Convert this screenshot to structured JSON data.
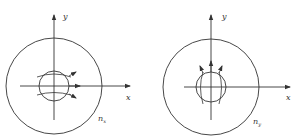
{
  "figure": {
    "panels": [
      {
        "id": "left",
        "axis_labels": {
          "x": "x",
          "y": "y"
        },
        "region_label": "n",
        "region_subscript": "x",
        "description": "Outer circle with small inner circle at origin; curved lines inside inner circle with arrows pointing along +x direction"
      },
      {
        "id": "right",
        "axis_labels": {
          "x": "x",
          "y": "y"
        },
        "region_label": "n",
        "region_subscript": "y",
        "description": "Outer circle with small inner circle at origin; curved lines inside inner circle with arrows pointing along +y direction"
      }
    ],
    "colors": {
      "stroke": "#333333",
      "background": "#ffffff"
    }
  }
}
